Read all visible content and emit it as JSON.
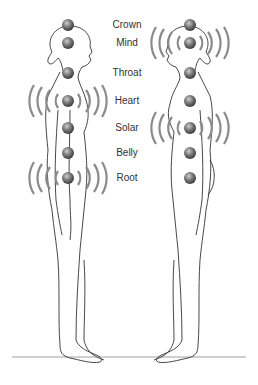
{
  "diagram": {
    "title": "",
    "chakras": [
      {
        "name": "Crown",
        "y": 25
      },
      {
        "name": "Mind",
        "y": 43
      },
      {
        "name": "Throat",
        "y": 73
      },
      {
        "name": "Heart",
        "y": 101
      },
      {
        "name": "Solar",
        "y": 128
      },
      {
        "name": "Belly",
        "y": 153
      },
      {
        "name": "Root",
        "y": 178
      }
    ],
    "left_figure": {
      "x": 68,
      "vibrating": [
        "Heart",
        "Root"
      ]
    },
    "right_figure": {
      "x": 190,
      "vibrating": [
        "Mind",
        "Solar"
      ]
    },
    "colors": {
      "dot": "#555555",
      "waves": "#8a8a8a",
      "line": "#333333"
    }
  }
}
